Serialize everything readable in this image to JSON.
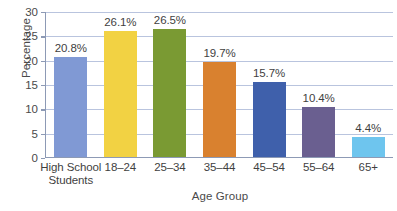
{
  "chart_data": {
    "type": "bar",
    "title": "",
    "xlabel": "Age Group",
    "ylabel": "Percentage",
    "categories": [
      "High School\nStudents",
      "18–24",
      "25–34",
      "35–44",
      "45–54",
      "55–64",
      "65+"
    ],
    "values": [
      20.8,
      26.1,
      26.5,
      19.7,
      15.7,
      10.4,
      4.4
    ],
    "value_labels": [
      "20.8%",
      "26.1%",
      "26.5%",
      "19.7%",
      "15.7%",
      "10.4%",
      "4.4%"
    ],
    "bar_colors": [
      "#8099d4",
      "#f2d243",
      "#7a9a33",
      "#d9812f",
      "#3f60ab",
      "#6a5f90",
      "#6ec5ee"
    ],
    "ylim": [
      0,
      30
    ],
    "yticks": [
      0,
      5,
      10,
      15,
      20,
      25,
      30
    ],
    "ytick_labels": [
      "0",
      "5",
      "10",
      "15",
      "20",
      "25",
      "30"
    ],
    "grid": "horizontal",
    "grid_color": "#b9c4de",
    "legend": "none",
    "axis_color": "#8d9ab5",
    "background": "#ffffff"
  },
  "xcat_lines": [
    [
      "High School",
      "Students"
    ],
    [
      "18–24",
      ""
    ],
    [
      "25–34",
      ""
    ],
    [
      "35–44",
      ""
    ],
    [
      "45–54",
      ""
    ],
    [
      "55–64",
      ""
    ],
    [
      "65+",
      ""
    ]
  ]
}
